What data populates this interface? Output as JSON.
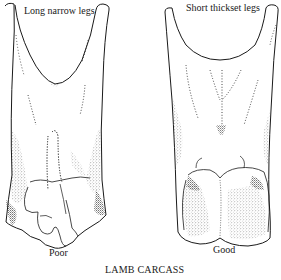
{
  "figure": {
    "caption": "LAMB CARCASS",
    "line_color": "#1a1a1a",
    "background": "#ffffff",
    "panels": [
      {
        "id": "poor",
        "heading": "Long narrow legs",
        "rating": "Poor"
      },
      {
        "id": "good",
        "heading": "Short thickset legs",
        "rating": "Good"
      }
    ]
  }
}
